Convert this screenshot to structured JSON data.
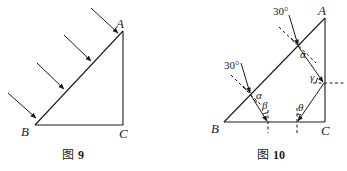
{
  "figures": [
    {
      "id": "fig9",
      "caption": {
        "prefix": "图",
        "number": "9"
      },
      "vertices": {
        "A": "A",
        "B": "B",
        "C": "C"
      },
      "description": "Right triangle ABC (right angle at C) with four parallel light rays incident on hypotenuse AB from upper-left"
    },
    {
      "id": "fig10",
      "caption": {
        "prefix": "图",
        "number": "10"
      },
      "vertices": {
        "A": "A",
        "B": "B",
        "C": "C"
      },
      "angles": {
        "incidence_upper": "30°",
        "incidence_lower": "30°",
        "alpha_upper": "α",
        "alpha_lower": "α",
        "beta": "β",
        "gamma": "γ",
        "theta": "θ"
      },
      "description": "Ray paths through prism ABC: two incident rays at 30° refract by angle α; one reflects at AC with angle γ, exits at BC with θ; other exits at BC with β"
    }
  ],
  "colors": {
    "line": "#1a1a1a",
    "background": "#ffffff"
  }
}
